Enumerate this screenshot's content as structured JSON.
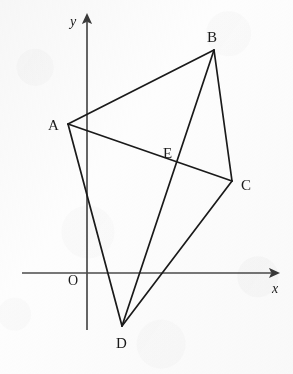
{
  "figure": {
    "kind": "geometry-diagram",
    "background_color": "#fdfdfd",
    "stroke_color": "#1a1a1a",
    "axis_color": "#4a4a4a"
  },
  "axes": {
    "x_label": "x",
    "y_label": "y",
    "origin_label": "O",
    "x_axis": {
      "x1": 22,
      "y1": 273,
      "x2": 277,
      "y2": 273,
      "arrow": "right"
    },
    "y_axis": {
      "x1": 87,
      "y1": 330,
      "x2": 87,
      "y2": 16,
      "arrow": "up"
    },
    "origin_label_pos": {
      "x": 68,
      "y": 285
    },
    "x_label_pos": {
      "x": 272,
      "y": 293
    },
    "y_label_pos": {
      "x": 70,
      "y": 26
    }
  },
  "points": [
    {
      "id": "A",
      "label": "A",
      "x": 68,
      "y": 124,
      "label_x": 48,
      "label_y": 130
    },
    {
      "id": "B",
      "label": "B",
      "x": 214,
      "y": 50,
      "label_x": 207,
      "label_y": 42
    },
    {
      "id": "C",
      "label": "C",
      "x": 232,
      "y": 181,
      "label_x": 241,
      "label_y": 190
    },
    {
      "id": "D",
      "label": "D",
      "x": 122,
      "y": 326,
      "label_x": 116,
      "label_y": 348
    },
    {
      "id": "E",
      "label": "E",
      "x": 177,
      "y": 162,
      "label_x": 163,
      "label_y": 158
    }
  ],
  "segments": [
    {
      "id": "AB",
      "from": "A",
      "to": "B",
      "x1": 68,
      "y1": 124,
      "x2": 214,
      "y2": 50
    },
    {
      "id": "AC",
      "from": "A",
      "to": "C",
      "x1": 68,
      "y1": 124,
      "x2": 232,
      "y2": 181
    },
    {
      "id": "AD",
      "from": "A",
      "to": "D",
      "x1": 68,
      "y1": 124,
      "x2": 122,
      "y2": 326
    },
    {
      "id": "BC",
      "from": "B",
      "to": "C",
      "x1": 214,
      "y1": 50,
      "x2": 232,
      "y2": 181
    },
    {
      "id": "BD",
      "from": "B",
      "to": "D",
      "x1": 214,
      "y1": 50,
      "x2": 122,
      "y2": 326
    },
    {
      "id": "CD",
      "from": "C",
      "to": "D",
      "x1": 232,
      "y1": 181,
      "x2": 122,
      "y2": 326
    }
  ]
}
